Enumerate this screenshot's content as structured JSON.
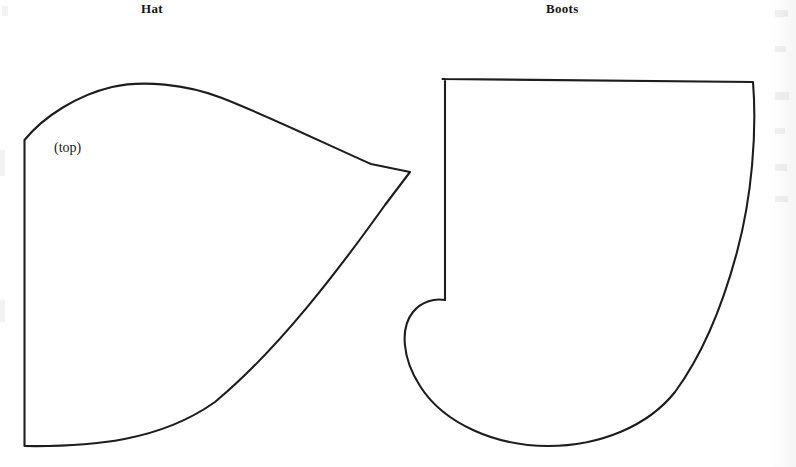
{
  "page": {
    "width": 796,
    "height": 467,
    "background_color": "#ffffff",
    "ink_color": "#1d1d1d",
    "document_type": "sewing pattern sheet"
  },
  "titles": {
    "hat": "Hat",
    "boots": "Boots"
  },
  "annotations": {
    "top": "(top)",
    "fold": "(place edge on fold)"
  },
  "pieces": [
    {
      "name": "hat",
      "label": "Hat",
      "annotations": [
        "(top)",
        "(place edge on fold)"
      ],
      "outline_description": "quarter-dome pattern piece with straight left fold edge, arched top curve, pointed right apex and a long concave bottom curve"
    },
    {
      "name": "boots",
      "label": "Boots",
      "annotations": [],
      "outline_description": "boot-shaped pattern piece with straight flat top, straight left leg edge, heel notch, rounded heel and toe sole curve, and a long curved right side"
    }
  ]
}
